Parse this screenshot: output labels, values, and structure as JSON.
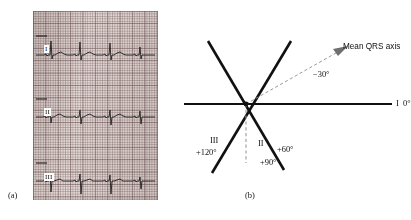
{
  "figure": {
    "panels": [
      {
        "id": "a",
        "caption": "(a)",
        "description": "ECG rhythm strip showing limb leads I, II and III on graph paper"
      },
      {
        "id": "b",
        "caption": "(b)",
        "description": "Hexaxial reference diagram of limb lead axes with mean QRS axis"
      }
    ]
  },
  "panel_a": {
    "caption": "(a)",
    "leads": [
      {
        "label": "I",
        "name": "lead-I"
      },
      {
        "label": "II",
        "name": "lead-II"
      },
      {
        "label": "III",
        "name": "lead-III"
      }
    ],
    "grid": {
      "paper_color": "#e4d9d6",
      "fine_line_color": "#786060",
      "bold_line_color": "#564242",
      "trace_color": "#241f1f"
    }
  },
  "panel_b": {
    "caption": "(b)",
    "center_label": "",
    "axes": [
      {
        "name": "lead-I-axis",
        "label": "I",
        "angle_label": "0°",
        "degrees": 0,
        "style": "solid"
      },
      {
        "name": "lead-II-axis",
        "label": "II",
        "angle_label": "+60°",
        "degrees": 60,
        "style": "solid"
      },
      {
        "name": "lead-III-axis",
        "label": "III",
        "angle_label": "+120°",
        "degrees": 120,
        "style": "solid"
      },
      {
        "name": "vertical-axis",
        "label": "",
        "angle_label": "+90°",
        "degrees": 90,
        "style": "dashed"
      }
    ],
    "mean_qrs": {
      "label": "Mean QRS axis",
      "angle_label": "−30°",
      "degrees": -30,
      "style": "dashed-arrow"
    },
    "colors": {
      "axis": "#111111",
      "dashed": "#9a9a9a",
      "text": "#111111"
    }
  }
}
